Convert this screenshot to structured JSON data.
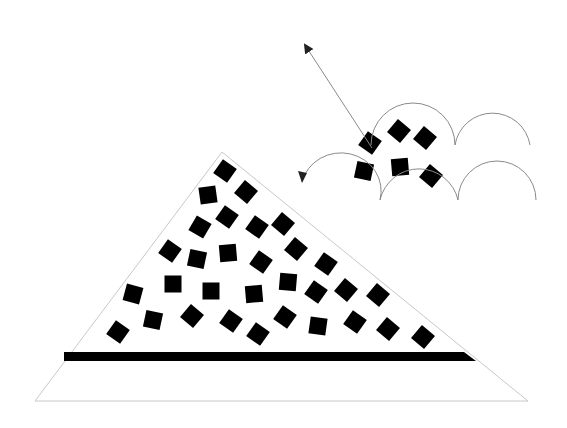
{
  "colors": {
    "background": "#ffffff",
    "outline": "#c8c8c8",
    "particle": "#000000",
    "arc": "#8a8a8a",
    "arrow": "#8a8a8a",
    "band": "#000000"
  },
  "pile": {
    "outline_points": "35,401 528,401 222,152",
    "band": {
      "points": "64,352 464,352 476,361 64,361"
    }
  },
  "particles": [
    {
      "x": 225,
      "y": 171,
      "r": 35
    },
    {
      "x": 208,
      "y": 195,
      "r": -8
    },
    {
      "x": 246,
      "y": 192,
      "r": 40
    },
    {
      "x": 227,
      "y": 217,
      "r": 35
    },
    {
      "x": 200,
      "y": 227,
      "r": 30
    },
    {
      "x": 257,
      "y": 227,
      "r": 35
    },
    {
      "x": 283,
      "y": 224,
      "r": 40
    },
    {
      "x": 170,
      "y": 251,
      "r": 35
    },
    {
      "x": 197,
      "y": 259,
      "r": 12
    },
    {
      "x": 228,
      "y": 253,
      "r": -5
    },
    {
      "x": 261,
      "y": 262,
      "r": 35
    },
    {
      "x": 296,
      "y": 249,
      "r": 40
    },
    {
      "x": 326,
      "y": 264,
      "r": 35
    },
    {
      "x": 133,
      "y": 294,
      "r": 15
    },
    {
      "x": 173,
      "y": 284,
      "r": 0
    },
    {
      "x": 211,
      "y": 291,
      "r": 0
    },
    {
      "x": 254,
      "y": 294,
      "r": -5
    },
    {
      "x": 288,
      "y": 282,
      "r": 5
    },
    {
      "x": 316,
      "y": 292,
      "r": 35
    },
    {
      "x": 346,
      "y": 290,
      "r": 40
    },
    {
      "x": 378,
      "y": 295,
      "r": 40
    },
    {
      "x": 118,
      "y": 332,
      "r": 35
    },
    {
      "x": 153,
      "y": 320,
      "r": 12
    },
    {
      "x": 192,
      "y": 316,
      "r": 40
    },
    {
      "x": 231,
      "y": 321,
      "r": 35
    },
    {
      "x": 258,
      "y": 334,
      "r": 35
    },
    {
      "x": 285,
      "y": 317,
      "r": 35
    },
    {
      "x": 318,
      "y": 326,
      "r": 8
    },
    {
      "x": 355,
      "y": 322,
      "r": 35
    },
    {
      "x": 388,
      "y": 329,
      "r": 40
    },
    {
      "x": 423,
      "y": 337,
      "r": 40
    },
    {
      "x": 370,
      "y": 143,
      "r": 35
    },
    {
      "x": 399,
      "y": 131,
      "r": 40
    },
    {
      "x": 425,
      "y": 138,
      "r": 40
    },
    {
      "x": 364,
      "y": 171,
      "r": 12
    },
    {
      "x": 400,
      "y": 167,
      "r": -5
    },
    {
      "x": 431,
      "y": 176,
      "r": 40
    }
  ],
  "particle_size": 17,
  "arcs_top": [
    {
      "d": "M 371 145 A 42 42 0 0 1 455 145"
    },
    {
      "d": "M 455 145 A 38 38 0 0 1 530 145"
    }
  ],
  "arcs_bottom": [
    {
      "d": "M 302 182 A 40 38 0 0 1 380 200"
    },
    {
      "d": "M 380 200 A 40 40 0 0 1 458 200"
    },
    {
      "d": "M 458 200 A 38 38 0 0 1 536 200"
    }
  ],
  "ejection_arrow": {
    "x1": 372,
    "y1": 148,
    "x2": 305,
    "y2": 45
  },
  "left_arrow_tip": {
    "x": 302,
    "y": 183
  }
}
